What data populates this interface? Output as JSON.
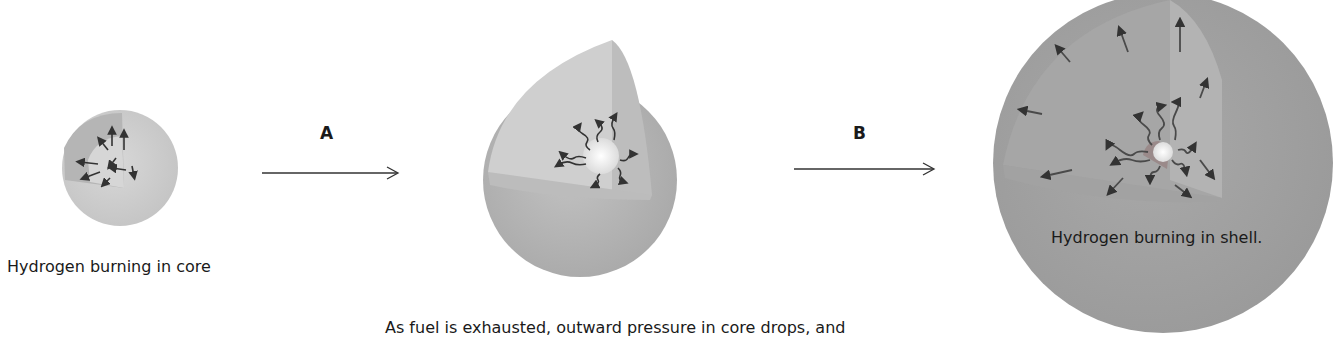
{
  "stages": [
    {
      "label": "Hydrogen burning in core"
    },
    {
      "label": ""
    },
    {
      "label": "Hydrogen burning in shell."
    }
  ],
  "transitions": [
    {
      "label": "A"
    },
    {
      "label": "B"
    }
  ],
  "caption": "As fuel is exhausted, outward pressure in core drops, and",
  "colors": {
    "star_fill": "#b8b8b8",
    "cutaway": "#cfcfcf",
    "core": "#f2f2f2",
    "arrow": "#444444"
  }
}
